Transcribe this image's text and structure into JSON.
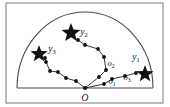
{
  "figure": {
    "name": "semicircular-search-region-diagram",
    "frame": {
      "x": 6,
      "y": 3,
      "width": 157,
      "height": 100,
      "stroke": "#7a7a7a"
    },
    "baseline": {
      "x1": 17,
      "y1": 88,
      "x2": 153,
      "y2": 88,
      "stroke": "#4a4a4a"
    },
    "arc": {
      "cx": 85,
      "cy": 88,
      "rx": 68,
      "ry": 76,
      "stroke": "#4a4a4a"
    },
    "origin": {
      "x": 85,
      "y": 88,
      "label": "O",
      "label_x": 85,
      "label_y": 101
    },
    "node_color": "#111111",
    "edge_color": "#222222",
    "star_color": "#111111",
    "targets": [
      {
        "id": "y1",
        "label": "y₁",
        "label_text": "y",
        "sub": "1",
        "star_x": 145,
        "star_y": 74,
        "star_r": 9,
        "label_x": 136,
        "label_y": 60
      },
      {
        "id": "y2",
        "label": "y₂",
        "label_text": "y",
        "sub": "2",
        "star_x": 71,
        "star_y": 33,
        "star_r": 10,
        "label_x": 84,
        "label_y": 35
      },
      {
        "id": "y3",
        "label": "y₃",
        "label_text": "y",
        "sub": "3",
        "star_x": 39,
        "star_y": 54,
        "star_r": 9,
        "label_x": 52,
        "label_y": 52
      }
    ],
    "waypoint_labels": [
      {
        "id": "o1",
        "label_text": "o",
        "sub": "1",
        "x": 112,
        "y": 84
      },
      {
        "id": "o2",
        "label_text": "o",
        "sub": "2",
        "x": 111,
        "y": 66
      },
      {
        "id": "o3",
        "label_text": "o",
        "sub": "3",
        "x": 127,
        "y": 80
      }
    ],
    "paths": [
      {
        "id": "path-y1",
        "points": [
          [
            85,
            88
          ],
          [
            104,
            84
          ],
          [
            112,
            79
          ],
          [
            125,
            76
          ],
          [
            136,
            73
          ]
        ],
        "nodes": [
          [
            104,
            84
          ],
          [
            112,
            79
          ],
          [
            125,
            76
          ],
          [
            136,
            73
          ]
        ]
      },
      {
        "id": "path-y2",
        "points": [
          [
            85,
            88
          ],
          [
            99,
            77
          ],
          [
            106,
            70
          ],
          [
            104,
            57
          ],
          [
            98,
            49
          ],
          [
            85,
            45
          ],
          [
            78,
            40
          ]
        ],
        "nodes": [
          [
            99,
            77
          ],
          [
            106,
            70
          ],
          [
            104,
            57
          ],
          [
            98,
            49
          ],
          [
            85,
            45
          ],
          [
            78,
            40
          ]
        ]
      },
      {
        "id": "path-y3",
        "points": [
          [
            85,
            88
          ],
          [
            76,
            81
          ],
          [
            66,
            78
          ],
          [
            58,
            72
          ],
          [
            50,
            71
          ],
          [
            46,
            62
          ],
          [
            45,
            58
          ]
        ],
        "nodes": [
          [
            76,
            81
          ],
          [
            66,
            78
          ],
          [
            58,
            72
          ],
          [
            50,
            71
          ],
          [
            46,
            62
          ],
          [
            45,
            58
          ]
        ]
      }
    ]
  }
}
